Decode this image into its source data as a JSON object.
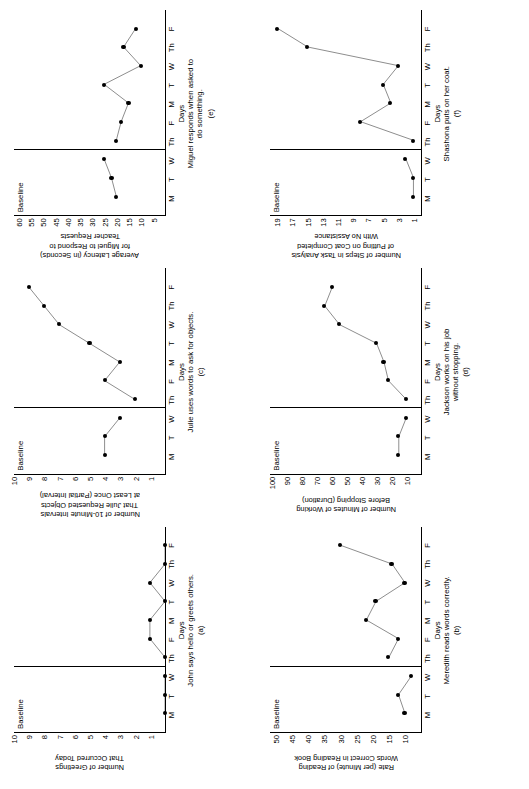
{
  "figure": {
    "orientation": "rotated-90-ccw",
    "panel_count": 6,
    "axis_color": "#000000",
    "marker_color": "#000000",
    "background": "#ffffff"
  },
  "common": {
    "phase_label": "Baseline",
    "xlabel": "Days",
    "day_labels": [
      "M",
      "T",
      "W",
      "Th",
      "F",
      "M",
      "T",
      "W",
      "Th",
      "F"
    ]
  },
  "chart_data": [
    {
      "id": "a",
      "type": "line",
      "panel_letter": "(a)",
      "title": "",
      "ylabel": "Number of Greetings\nThat Occurred Today",
      "xlabel": "Days",
      "caption": "John says hello or greets others.",
      "phase_label": "Baseline",
      "phase_change_after_index": 3,
      "categories": [
        "M",
        "T",
        "W",
        "Th",
        "F",
        "M",
        "T",
        "W",
        "Th",
        "F"
      ],
      "yticks": [
        1,
        2,
        3,
        4,
        5,
        6,
        7,
        8,
        9,
        10
      ],
      "ylim": [
        0,
        10
      ],
      "grid": false,
      "legend": "none",
      "series": [
        {
          "name": "Baseline",
          "x": [
            "M",
            "T",
            "W"
          ],
          "values": [
            0,
            0,
            0
          ]
        },
        {
          "name": "Intervention",
          "x": [
            "Th",
            "F",
            "M",
            "T",
            "W",
            "Th",
            "F"
          ],
          "values": [
            0,
            1,
            1,
            0,
            1,
            0,
            0
          ]
        }
      ]
    },
    {
      "id": "b",
      "type": "line",
      "panel_letter": "(b)",
      "title": "",
      "ylabel": "Rate (per Minute) of Reading\nWords Correct in Reading Book",
      "xlabel": "Days",
      "caption": "Meredith reads words correctly.",
      "phase_label": "Baseline",
      "phase_change_after_index": 3,
      "categories": [
        "M",
        "T",
        "W",
        "Th",
        "F",
        "M",
        "T",
        "W",
        "Th",
        "F"
      ],
      "yticks": [
        10,
        15,
        20,
        25,
        30,
        35,
        40,
        45,
        50
      ],
      "ylim": [
        5,
        52
      ],
      "grid": false,
      "legend": "none",
      "series": [
        {
          "name": "Baseline",
          "x": [
            "M",
            "T",
            "W"
          ],
          "values": [
            10,
            12,
            8
          ]
        },
        {
          "name": "Intervention",
          "x": [
            "Th",
            "F",
            "M",
            "T",
            "W",
            "Th",
            "F"
          ],
          "values": [
            15,
            12,
            22,
            19,
            10,
            14,
            30
          ]
        }
      ]
    },
    {
      "id": "c",
      "type": "line",
      "panel_letter": "(c)",
      "title": "",
      "ylabel": "Number of 10-Minute Intervals\nThat Julie Requested Objects\nat Least Once (Partial Interval)",
      "xlabel": "Days",
      "caption": "Julie uses words to ask for objects.",
      "phase_label": "Baseline",
      "phase_change_after_index": 3,
      "categories": [
        "M",
        "T",
        "W",
        "Th",
        "F",
        "M",
        "T",
        "W",
        "Th",
        "F"
      ],
      "yticks": [
        1,
        2,
        3,
        4,
        5,
        6,
        7,
        8,
        9,
        10
      ],
      "ylim": [
        0,
        10
      ],
      "grid": false,
      "legend": "none",
      "series": [
        {
          "name": "Baseline",
          "x": [
            "M",
            "T",
            "W"
          ],
          "values": [
            4,
            4,
            3
          ]
        },
        {
          "name": "Intervention",
          "x": [
            "Th",
            "F",
            "M",
            "T",
            "W",
            "Th",
            "F"
          ],
          "values": [
            2,
            4,
            3,
            5,
            7,
            8,
            9
          ]
        }
      ]
    },
    {
      "id": "d",
      "type": "line",
      "panel_letter": "(d)",
      "title": "",
      "ylabel": "Number of Minutes of Working\nBefore Stopping (Duration)",
      "xlabel": "Days",
      "caption": "Jackson works on his job\nwithout stopping.",
      "phase_label": "Baseline",
      "phase_change_after_index": 3,
      "categories": [
        "M",
        "T",
        "W",
        "Th",
        "F",
        "M",
        "T",
        "W",
        "Th",
        "F"
      ],
      "yticks": [
        10,
        20,
        30,
        40,
        50,
        60,
        70,
        80,
        90,
        100
      ],
      "ylim": [
        0,
        102
      ],
      "grid": false,
      "legend": "none",
      "series": [
        {
          "name": "Baseline",
          "x": [
            "M",
            "T",
            "W"
          ],
          "values": [
            15,
            15,
            10
          ]
        },
        {
          "name": "Intervention",
          "x": [
            "Th",
            "F",
            "M",
            "T",
            "W",
            "Th",
            "F"
          ],
          "values": [
            10,
            22,
            25,
            30,
            55,
            65,
            60
          ]
        }
      ]
    },
    {
      "id": "e",
      "type": "line",
      "panel_letter": "(e)",
      "title": "",
      "ylabel": "Average Latency (in Seconds)\nfor Miguel to Respond to\nTeacher Requests",
      "xlabel": "Days",
      "caption": "Miguel responds when asked to\ndo something.",
      "phase_label": "Baseline",
      "phase_change_after_index": 3,
      "categories": [
        "M",
        "T",
        "W",
        "Th",
        "F",
        "M",
        "T",
        "W",
        "Th",
        "F"
      ],
      "yticks": [
        5,
        10,
        15,
        20,
        25,
        30,
        35,
        40,
        45,
        50,
        55,
        60
      ],
      "ylim": [
        0,
        62
      ],
      "grid": false,
      "legend": "none",
      "series": [
        {
          "name": "Baseline",
          "x": [
            "M",
            "T",
            "W"
          ],
          "values": [
            20,
            22,
            25
          ]
        },
        {
          "name": "Intervention",
          "x": [
            "Th",
            "F",
            "M",
            "T",
            "W",
            "Th",
            "F"
          ],
          "values": [
            20,
            18,
            15,
            25,
            10,
            17,
            12
          ]
        }
      ]
    },
    {
      "id": "f",
      "type": "line",
      "panel_letter": "(f)",
      "title": "",
      "ylabel": "Number of Steps in Task Analysis\nof Putting on Coat Completed\nWith No Assistance",
      "xlabel": "Days",
      "caption": "Shashona puts on her coat.",
      "phase_label": "Baseline",
      "phase_change_after_index": 3,
      "categories": [
        "M",
        "T",
        "W",
        "Th",
        "F",
        "M",
        "T",
        "W",
        "Th",
        "F"
      ],
      "yticks": [
        1,
        3,
        5,
        7,
        9,
        11,
        13,
        15,
        17,
        19
      ],
      "ylim": [
        0,
        20
      ],
      "grid": false,
      "legend": "none",
      "series": [
        {
          "name": "Baseline",
          "x": [
            "M",
            "T",
            "W"
          ],
          "values": [
            1,
            1,
            2
          ]
        },
        {
          "name": "Intervention",
          "x": [
            "Th",
            "F",
            "M",
            "T",
            "W",
            "Th",
            "F"
          ],
          "values": [
            1,
            8,
            4,
            5,
            3,
            15,
            19
          ]
        }
      ]
    }
  ]
}
